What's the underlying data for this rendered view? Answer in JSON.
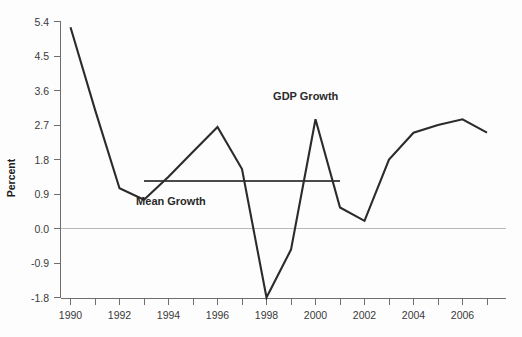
{
  "chart_data": {
    "type": "line",
    "title": "",
    "subtitle": "",
    "xlabel": "",
    "ylabel": "Percent",
    "xlim": [
      1989.5,
      2007.6
    ],
    "ylim": [
      -1.8,
      5.4
    ],
    "grid": false,
    "legend_position": "inline-annotation",
    "x": [
      1990,
      1991,
      1992,
      1993,
      1994,
      1995,
      1996,
      1997,
      1998,
      1999,
      2000,
      2001,
      2002,
      2003,
      2004,
      2005,
      2006,
      2007
    ],
    "series": [
      {
        "name": "GDP Growth",
        "color": "#2b2b2b",
        "values": [
          5.25,
          3.1,
          1.05,
          0.75,
          1.35,
          2.0,
          2.65,
          1.55,
          -1.8,
          -0.55,
          2.85,
          0.55,
          0.2,
          1.8,
          2.5,
          2.7,
          2.85,
          2.5
        ]
      }
    ],
    "reference_lines": [
      {
        "name": "Mean Growth",
        "orientation": "horizontal",
        "value": 1.23,
        "x_start": 1993,
        "x_end": 2001,
        "color": "#4a4a4a"
      }
    ],
    "annotations": [
      {
        "name": "gdp-growth-label",
        "text": "GDP Growth",
        "x": 1999.6,
        "y": 3.35
      },
      {
        "name": "mean-growth-label",
        "text": "Mean Growth",
        "x": 1994.1,
        "y": 0.62
      }
    ],
    "y_ticks": [
      "5.4",
      "4.5",
      "3.6",
      "2.7",
      "1.8",
      "0.9",
      "0.0",
      "-0.9",
      "-1.8"
    ],
    "y_tick_values": [
      5.4,
      4.5,
      3.6,
      2.7,
      1.8,
      0.9,
      0.0,
      -0.9,
      -1.8
    ],
    "x_ticks": [
      "1990",
      "1992",
      "1994",
      "1996",
      "1998",
      "2000",
      "2002",
      "2004",
      "2006"
    ],
    "x_tick_values": [
      1990,
      1992,
      1994,
      1996,
      1998,
      2000,
      2002,
      2004,
      2006
    ],
    "x_minor_tick_values": [
      1991,
      1993,
      1995,
      1997,
      1999,
      2001,
      2003,
      2005,
      2007
    ]
  },
  "axes": {
    "y_axis_title": "Percent"
  }
}
